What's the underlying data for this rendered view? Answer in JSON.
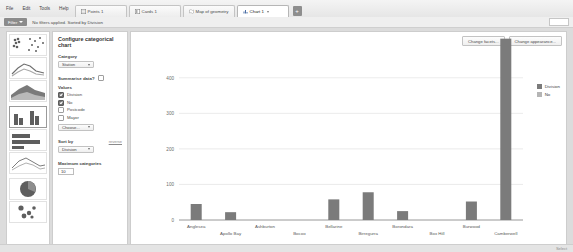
{
  "menu": {
    "items": [
      {
        "label": "File"
      },
      {
        "label": "Edit"
      },
      {
        "label": "Tools"
      },
      {
        "label": "Help"
      }
    ]
  },
  "tabs": [
    {
      "label": "Points 1",
      "icon": "grid-icon",
      "active": false
    },
    {
      "label": "Cards 1",
      "icon": "cards-icon",
      "active": false
    },
    {
      "label": "Map of geometry",
      "icon": "map-icon",
      "active": false
    },
    {
      "label": "Chart 1",
      "icon": "chart-icon",
      "active": true
    }
  ],
  "tab_add_label": "+",
  "filter_bar": {
    "button_label": "Filter",
    "status_text": "No filters applied. Sorted by Division"
  },
  "chart_types": [
    {
      "name": "scatter-matrix-thumb",
      "selected": false
    },
    {
      "name": "line-chart-thumb",
      "selected": false
    },
    {
      "name": "area-chart-thumb",
      "selected": false
    },
    {
      "name": "bar-chart-thumb",
      "selected": true
    },
    {
      "name": "horizontal-bar-chart-thumb",
      "selected": false
    },
    {
      "name": "line-chart-2-thumb",
      "selected": false
    },
    {
      "name": "pie-chart-thumb",
      "selected": false
    },
    {
      "name": "bubble-chart-thumb",
      "selected": false
    }
  ],
  "config": {
    "title": "Configure categorical chart",
    "category_label": "Category",
    "category_value": "Station",
    "summarise_label": "Summarise data?",
    "summarise_checked": false,
    "values_label": "Values",
    "values": [
      {
        "label": "Division",
        "checked": true
      },
      {
        "label": "No",
        "checked": true
      },
      {
        "label": "Postcode",
        "checked": false
      },
      {
        "label": "Mayor",
        "checked": false
      }
    ],
    "choose_button": "Choose...",
    "sort_by_label": "Sort by",
    "reverse_link": "reverse",
    "sort_by_value": "Division",
    "max_categories_label": "Maximum categories",
    "max_categories_value": "10"
  },
  "chart_toolbar": {
    "facets_button": "Change facets...",
    "appearance_button": "Change appearance..."
  },
  "status": {
    "right_text": "Select"
  },
  "chart_data": {
    "type": "bar",
    "title": "",
    "xlabel": "",
    "ylabel": "",
    "ylim": [
      0,
      450
    ],
    "yticks": [
      0,
      100,
      200,
      300,
      400
    ],
    "grid": true,
    "legend_position": "right",
    "categories": [
      "Anglesea",
      "Apollo Bay",
      "Ashburton",
      "Bocoo",
      "Bellarine",
      "Birregurra",
      "Borondara",
      "Box Hill",
      "Burwood",
      "Camberwell"
    ],
    "series": [
      {
        "name": "Division",
        "color": "#7b7b7b",
        "values": [
          45,
          22,
          0,
          0,
          58,
          78,
          25,
          0,
          52,
          510
        ]
      },
      {
        "name": "No",
        "color": "#b5b5b5",
        "values": [
          0,
          0,
          0,
          0,
          0,
          0,
          0,
          0,
          0,
          0
        ]
      }
    ]
  }
}
